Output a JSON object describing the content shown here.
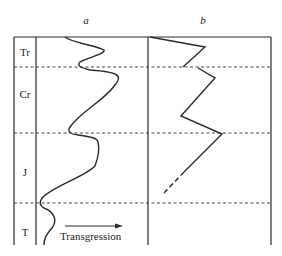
{
  "columns": {
    "a": {
      "label": "a"
    },
    "b": {
      "label": "b"
    }
  },
  "periods": [
    {
      "label": "Tr",
      "y": 52
    },
    {
      "label": "Cr",
      "y": 94
    },
    {
      "label": "J",
      "y": 172
    },
    {
      "label": "T",
      "y": 232
    }
  ],
  "arrow_label": "Transgression",
  "colors": {
    "line": "#2a2a2a",
    "dashed": "#444444"
  }
}
